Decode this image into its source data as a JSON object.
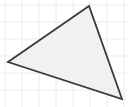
{
  "figure": {
    "width": 128,
    "height": 107,
    "background_color": "#ffffff",
    "title": "",
    "caption": ""
  },
  "grid": {
    "visible": true,
    "color": "#ececec",
    "line_width": 1,
    "spacing": 17,
    "x_lines": [
      5,
      22,
      39,
      56,
      73,
      90,
      107,
      124
    ],
    "y_lines": [
      5,
      22,
      39,
      56,
      73,
      90,
      107
    ]
  },
  "shape": {
    "type": "triangle",
    "name": "triangle",
    "fill_color": "#f1f1f1",
    "stroke_color": "#3a3a3a",
    "stroke_width": 1.8,
    "vertices": [
      {
        "label": "apex",
        "x": 89,
        "y": 6
      },
      {
        "label": "left",
        "x": 8,
        "y": 62
      },
      {
        "label": "bottom-right",
        "x": 122,
        "y": 99
      }
    ],
    "points_attr": "89,6 8,62 122,99"
  }
}
